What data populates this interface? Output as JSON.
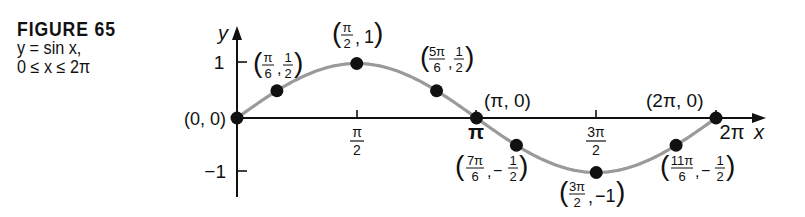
{
  "caption": {
    "figure_label": "FIGURE 65",
    "equation": "y = sin x,",
    "domain": "0 ≤ x ≤ 2π"
  },
  "chart_data": {
    "type": "line",
    "title": "y = sin x, 0 ≤ x ≤ 2π",
    "function": "sin",
    "xlabel": "x",
    "ylabel": "y",
    "xlim": [
      0,
      6.2832
    ],
    "ylim": [
      -1,
      1
    ],
    "x_ticks": [
      {
        "value": 1.5708,
        "label_num": "π",
        "label_den": "2"
      },
      {
        "value": 3.1416,
        "label": "π"
      },
      {
        "value": 4.7124,
        "label_num": "3π",
        "label_den": "2"
      },
      {
        "value": 6.2832,
        "label": "2π"
      }
    ],
    "y_ticks": [
      {
        "value": 1,
        "label": "1"
      },
      {
        "value": -1,
        "label": "−1"
      }
    ],
    "curve_color": "#9a9a9a",
    "point_color": "#111111",
    "points": [
      {
        "x": 0,
        "y": 0,
        "label": "(0, 0)"
      },
      {
        "x": 0.5236,
        "y": 0.5,
        "label": "(π/6, 1/2)"
      },
      {
        "x": 1.5708,
        "y": 1,
        "label": "(π/2, 1)"
      },
      {
        "x": 2.618,
        "y": 0.5,
        "label": "(5π/6, 1/2)"
      },
      {
        "x": 3.1416,
        "y": 0,
        "label": "(π, 0)"
      },
      {
        "x": 3.6652,
        "y": -0.5,
        "label": "(7π/6, −1/2)"
      },
      {
        "x": 4.7124,
        "y": -1,
        "label": "(3π/2, −1)"
      },
      {
        "x": 5.7596,
        "y": -0.5,
        "label": "(11π/6, −1/2)"
      },
      {
        "x": 6.2832,
        "y": 0,
        "label": "(2π, 0)"
      }
    ],
    "grid": false,
    "legend": null
  },
  "labels": {
    "x_axis": "x",
    "y_axis": "y",
    "ytick_1": "1",
    "ytick_neg1": "−1",
    "xtick_pi_half_num": "π",
    "xtick_pi_half_den": "2",
    "xtick_pi": "π",
    "xtick_3pi_half_num": "3π",
    "xtick_3pi_half_den": "2",
    "xtick_2pi": "2π",
    "p0": "(0, 0)",
    "p1_num_x": "π",
    "p1_den_x": "6",
    "p1_num_y": "1",
    "p1_den_y": "2",
    "p2_num_x": "π",
    "p2_den_x": "2",
    "p2_y": "1",
    "p3_num_x": "5π",
    "p3_den_x": "6",
    "p3_num_y": "1",
    "p3_den_y": "2",
    "p4": "(π, 0)",
    "p5_num_x": "7π",
    "p5_den_x": "6",
    "p5_num_y": "1",
    "p5_den_y": "2",
    "p6_num_x": "3π",
    "p6_den_x": "2",
    "p6_y": "−1",
    "p7_num_x": "11π",
    "p7_den_x": "6",
    "p7_num_y": "1",
    "p7_den_y": "2",
    "p8": "(2π, 0)"
  }
}
